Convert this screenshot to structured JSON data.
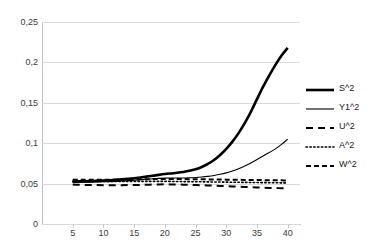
{
  "chart_data": {
    "type": "line",
    "title": "",
    "xlabel": "",
    "ylabel": "",
    "xlim": [
      0,
      42
    ],
    "ylim": [
      0,
      0.25
    ],
    "grid": true,
    "legend_position": "right",
    "decimal_separator": ",",
    "x": [
      5,
      6,
      7,
      8,
      9,
      10,
      11,
      12,
      13,
      14,
      15,
      16,
      17,
      18,
      19,
      20,
      21,
      22,
      23,
      24,
      25,
      26,
      27,
      28,
      29,
      30,
      31,
      32,
      33,
      34,
      35,
      36,
      37,
      38,
      39,
      40
    ],
    "xticks": [
      5,
      10,
      15,
      20,
      25,
      30,
      35,
      40
    ],
    "yticks": [
      0,
      0.05,
      0.1,
      0.15,
      0.2,
      0.25
    ],
    "ytick_labels": [
      "0",
      "0,05",
      "0,1",
      "0,15",
      "0,2",
      "0,25"
    ],
    "xtick_labels": [
      "5",
      "10",
      "15",
      "20",
      "25",
      "30",
      "35",
      "40"
    ],
    "series": [
      {
        "name": "S^2",
        "style": "solid",
        "width": 2.6,
        "color": "#000000",
        "values": [
          0.0525,
          0.0527,
          0.0529,
          0.0531,
          0.0534,
          0.0537,
          0.0541,
          0.0546,
          0.0552,
          0.0559,
          0.0567,
          0.0576,
          0.0586,
          0.0597,
          0.0608,
          0.0618,
          0.0626,
          0.0634,
          0.0644,
          0.0658,
          0.0678,
          0.0706,
          0.0744,
          0.0793,
          0.0855,
          0.093,
          0.102,
          0.1125,
          0.1248,
          0.1388,
          0.1545,
          0.17,
          0.184,
          0.197,
          0.2085,
          0.218
        ]
      },
      {
        "name": "Y1^2",
        "style": "solid",
        "width": 1.1,
        "color": "#000000",
        "values": [
          0.0515,
          0.0516,
          0.0517,
          0.0518,
          0.052,
          0.0522,
          0.0525,
          0.0528,
          0.0532,
          0.0537,
          0.0542,
          0.0548,
          0.0554,
          0.056,
          0.0565,
          0.0568,
          0.0569,
          0.0569,
          0.057,
          0.0572,
          0.0576,
          0.0582,
          0.059,
          0.0601,
          0.0615,
          0.0633,
          0.0656,
          0.0684,
          0.0717,
          0.0755,
          0.0798,
          0.0842,
          0.0885,
          0.093,
          0.0985,
          0.105
        ]
      },
      {
        "name": "U^2",
        "style": "long-dash",
        "width": 2.0,
        "color": "#000000",
        "values": [
          0.0488,
          0.0486,
          0.0484,
          0.0483,
          0.0482,
          0.0481,
          0.0481,
          0.0481,
          0.0481,
          0.0482,
          0.0483,
          0.0484,
          0.0486,
          0.0488,
          0.049,
          0.0491,
          0.049,
          0.0489,
          0.0487,
          0.0485,
          0.0483,
          0.048,
          0.0477,
          0.0474,
          0.0471,
          0.0468,
          0.0465,
          0.0462,
          0.0459,
          0.0456,
          0.0453,
          0.045,
          0.0447,
          0.0445,
          0.0443,
          0.0441
        ]
      },
      {
        "name": "A^2",
        "style": "dotted",
        "width": 1.6,
        "color": "#000000",
        "values": [
          0.0528,
          0.0528,
          0.0528,
          0.0528,
          0.0528,
          0.0528,
          0.0528,
          0.0528,
          0.0528,
          0.0528,
          0.0528,
          0.0528,
          0.0528,
          0.0528,
          0.0528,
          0.0528,
          0.0527,
          0.0526,
          0.0525,
          0.0524,
          0.0523,
          0.0522,
          0.0521,
          0.052,
          0.0519,
          0.0518,
          0.0517,
          0.0516,
          0.0515,
          0.0514,
          0.0513,
          0.0512,
          0.0511,
          0.051,
          0.0509,
          0.0508
        ]
      },
      {
        "name": "W^2",
        "style": "dash",
        "width": 2.0,
        "color": "#000000",
        "values": [
          0.0548,
          0.0548,
          0.0548,
          0.0548,
          0.0548,
          0.0548,
          0.0549,
          0.0549,
          0.055,
          0.0551,
          0.0552,
          0.0553,
          0.0554,
          0.0556,
          0.0557,
          0.0558,
          0.0558,
          0.0557,
          0.0556,
          0.0555,
          0.0554,
          0.0553,
          0.0552,
          0.0551,
          0.055,
          0.0549,
          0.0548,
          0.0547,
          0.0546,
          0.0545,
          0.0544,
          0.0543,
          0.0542,
          0.0541,
          0.054,
          0.0539
        ]
      }
    ]
  },
  "legend": {
    "items": [
      {
        "label": "S^2"
      },
      {
        "label": "Y1^2"
      },
      {
        "label": "U^2"
      },
      {
        "label": "A^2"
      },
      {
        "label": "W^2"
      }
    ]
  },
  "colors": {
    "grid": "#d9d9d9",
    "axis": "#bfbfbf",
    "text": "#3a3a3a",
    "series": "#000000"
  }
}
